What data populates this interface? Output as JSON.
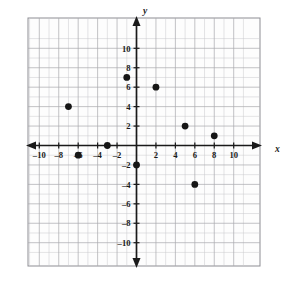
{
  "chart_data": {
    "type": "scatter",
    "title": "",
    "xlabel": "x",
    "ylabel": "y",
    "xlim": [
      -11.5,
      11.5
    ],
    "ylim": [
      -11.5,
      11.5
    ],
    "grid": true,
    "grid_step": 1,
    "legend": "none",
    "x_ticks": [
      -10,
      -8,
      -6,
      -4,
      -2,
      2,
      4,
      6,
      8,
      10
    ],
    "y_ticks": [
      10,
      8,
      6,
      4,
      2,
      -2,
      -4,
      -6,
      -8,
      -10
    ],
    "x_tick_labels": [
      "–10",
      "–8",
      "–6",
      "–4",
      "–2",
      "2",
      "4",
      "6",
      "8",
      "10"
    ],
    "y_tick_labels": [
      "10",
      "8",
      "6",
      "4",
      "2",
      "–2",
      "–4",
      "–6",
      "–8",
      "–10"
    ],
    "points": [
      {
        "x": -7,
        "y": 4
      },
      {
        "x": -6,
        "y": -1
      },
      {
        "x": -3,
        "y": 0
      },
      {
        "x": -1,
        "y": 7
      },
      {
        "x": 0,
        "y": -2
      },
      {
        "x": 2,
        "y": 6
      },
      {
        "x": 5,
        "y": 2
      },
      {
        "x": 6,
        "y": -4
      },
      {
        "x": 8,
        "y": 1
      }
    ],
    "point_color": "#161616",
    "grid_color": "#c9c9cd",
    "axis_color": "#1a1a1a"
  }
}
